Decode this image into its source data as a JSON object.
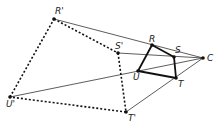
{
  "diagram": {
    "center": {
      "label": "C",
      "x": 203,
      "y": 58
    },
    "original": {
      "points": [
        {
          "label": "R",
          "x": 152,
          "y": 45,
          "lx": 149,
          "ly": 42
        },
        {
          "label": "S",
          "x": 174,
          "y": 57,
          "lx": 175,
          "ly": 53
        },
        {
          "label": "T",
          "x": 176,
          "y": 78,
          "lx": 178,
          "ly": 87
        },
        {
          "label": "U",
          "x": 138,
          "y": 71,
          "lx": 133,
          "ly": 80
        }
      ],
      "style": "solid-thick"
    },
    "image": {
      "points": [
        {
          "label": "R'",
          "x": 54,
          "y": 19,
          "lx": 55,
          "ly": 14
        },
        {
          "label": "S'",
          "x": 118,
          "y": 53,
          "lx": 115,
          "ly": 49
        },
        {
          "label": "T'",
          "x": 126,
          "y": 112,
          "lx": 128,
          "ly": 121
        },
        {
          "label": "U'",
          "x": 10,
          "y": 97,
          "lx": 6,
          "ly": 107
        }
      ],
      "style": "dotted"
    },
    "colors": {
      "line": "#333333",
      "point": "#111111"
    }
  }
}
